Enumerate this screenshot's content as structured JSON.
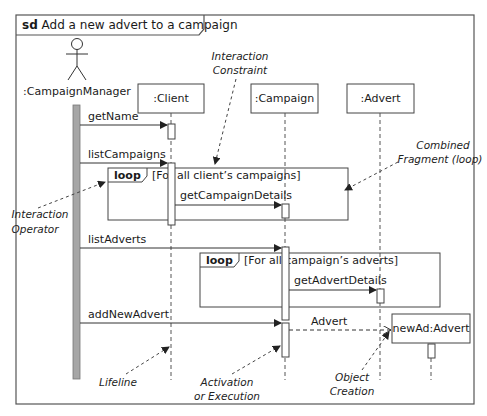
{
  "diagram": {
    "type": "UML sequence diagram",
    "frame": {
      "keyword": "sd",
      "title": "Add a new advert to a campaign"
    },
    "actor": {
      "label": ":CampaignManager"
    },
    "lifelines": [
      {
        "label": ":Client"
      },
      {
        "label": ":Campaign"
      },
      {
        "label": ":Advert"
      }
    ],
    "created_object": {
      "label": "newAd:Advert"
    },
    "messages": [
      {
        "label": "getName",
        "from": ":CampaignManager",
        "to": ":Client"
      },
      {
        "label": "listCampaigns",
        "from": ":CampaignManager",
        "to": ":Client"
      },
      {
        "label": "getCampaignDetails",
        "from": ":Client",
        "to": ":Campaign"
      },
      {
        "label": "listAdverts",
        "from": ":CampaignManager",
        "to": ":Campaign"
      },
      {
        "label": "getAdvertDetails",
        "from": ":Campaign",
        "to": ":Advert"
      },
      {
        "label": "addNewAdvert",
        "from": ":CampaignManager",
        "to": ":Campaign"
      },
      {
        "label": "Advert",
        "from": ":Campaign",
        "to": "newAd:Advert"
      }
    ],
    "fragments": [
      {
        "operator": "loop",
        "guard": "[For all client’s campaigns]"
      },
      {
        "operator": "loop",
        "guard": "[For all campaign’s adverts]"
      }
    ],
    "annotations": {
      "interaction_constraint": [
        "Interaction",
        "Constraint"
      ],
      "combined_fragment": [
        "Combined",
        "Fragment (loop)"
      ],
      "interaction_operator": [
        "Interaction",
        "Operator"
      ],
      "lifeline": [
        "Lifeline"
      ],
      "activation": [
        "Activation",
        "or Execution"
      ],
      "object_creation": [
        "Object",
        "Creation"
      ]
    }
  }
}
